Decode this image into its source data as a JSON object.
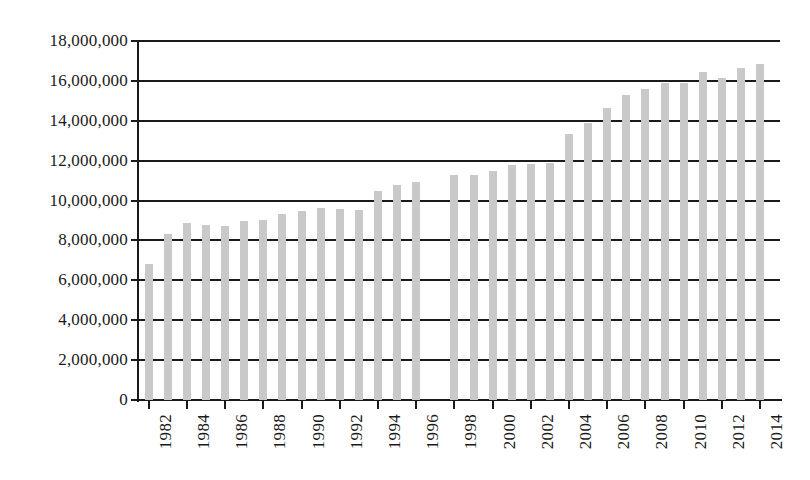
{
  "chart_data": {
    "type": "bar",
    "title": "",
    "xlabel": "",
    "ylabel": "",
    "ylim": [
      0,
      18000000
    ],
    "ytick_step": 2000000,
    "grid": "horizontal",
    "legend": "none",
    "bar_color": "#c9c9c9",
    "axis_color": "#1a1a1a",
    "background": "#ffffff",
    "xtick_interval_years": 2,
    "xlabel_rotation_deg": -90,
    "ytick_labels": [
      "0",
      "2,000,000",
      "4,000,000",
      "6,000,000",
      "8,000,000",
      "10,000,000",
      "12,000,000",
      "14,000,000",
      "16,000,000",
      "18,000,000"
    ],
    "ytick_values": [
      0,
      2000000,
      4000000,
      6000000,
      8000000,
      10000000,
      12000000,
      14000000,
      16000000,
      18000000
    ],
    "xtick_labels": [
      "1982",
      "1984",
      "1986",
      "1988",
      "1990",
      "1992",
      "1994",
      "1996",
      "1998",
      "2000",
      "2002",
      "2004",
      "2006",
      "2008",
      "2010",
      "2012",
      "2014"
    ],
    "categories": [
      "1982",
      "1983",
      "1984",
      "1985",
      "1986",
      "1987",
      "1988",
      "1989",
      "1990",
      "1991",
      "1992",
      "1993",
      "1994",
      "1995",
      "1996",
      "1997",
      "1998",
      "1999",
      "2000",
      "2001",
      "2002",
      "2003",
      "2004",
      "2005",
      "2006",
      "2007",
      "2008",
      "2009",
      "2010",
      "2011",
      "2012",
      "2013",
      "2014"
    ],
    "values": [
      6800000,
      8300000,
      8900000,
      8800000,
      8750000,
      9000000,
      9050000,
      9350000,
      9500000,
      9650000,
      9600000,
      9550000,
      10500000,
      10800000,
      10950000,
      null,
      11300000,
      11300000,
      11500000,
      11800000,
      11850000,
      11900000,
      13350000,
      13900000,
      14650000,
      15300000,
      15600000,
      15900000,
      15900000,
      16450000,
      16150000,
      16650000,
      16850000
    ],
    "missing_categories": [
      "1997"
    ]
  }
}
